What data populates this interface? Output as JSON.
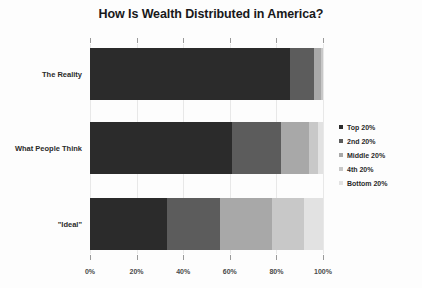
{
  "chart_data": {
    "type": "bar",
    "orientation": "horizontal",
    "stacked": true,
    "stack_mode": "percent",
    "title": "How Is Wealth Distributed in America?",
    "xlabel": "",
    "ylabel": "",
    "xlim": [
      0,
      100
    ],
    "xticks": [
      0,
      20,
      40,
      60,
      80,
      100
    ],
    "xtick_labels": [
      "0%",
      "20%",
      "40%",
      "60%",
      "80%",
      "100%"
    ],
    "grid": true,
    "legend_position": "right",
    "categories": [
      "The Reality",
      "What People Think",
      "\"Ideal\""
    ],
    "series": [
      {
        "name": "Top 20%",
        "color": "#2b2b2b",
        "values": [
          86,
          61,
          33
        ]
      },
      {
        "name": "2nd 20%",
        "color": "#5c5c5c",
        "values": [
          10,
          21,
          23
        ]
      },
      {
        "name": "Middle 20%",
        "color": "#a8a8a8",
        "values": [
          3,
          12,
          22
        ]
      },
      {
        "name": "4th 20%",
        "color": "#c8c8c8",
        "values": [
          1,
          4,
          14
        ]
      },
      {
        "name": "Bottom 20%",
        "color": "#e2e2e2",
        "values": [
          0,
          2,
          8
        ]
      }
    ]
  },
  "legend": {
    "items": [
      {
        "label": "Top 20%"
      },
      {
        "label": "2nd 20%"
      },
      {
        "label": "Middle 20%"
      },
      {
        "label": "4th 20%"
      },
      {
        "label": "Bottom 20%"
      }
    ]
  }
}
